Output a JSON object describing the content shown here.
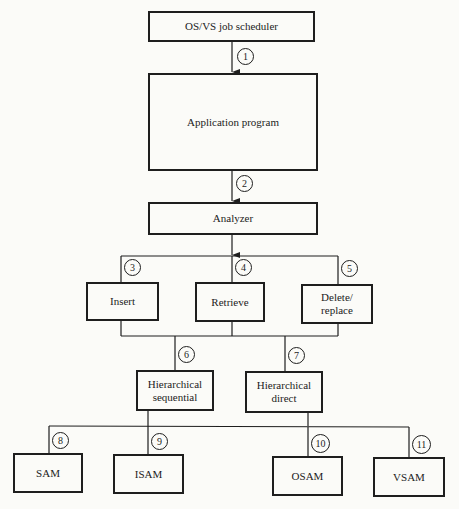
{
  "nodes": {
    "scheduler": "OS/VS job scheduler",
    "application": "Application program",
    "analyzer": "Analyzer",
    "insert": "Insert",
    "retrieve": "Retrieve",
    "delete_replace": "Delete/\nreplace",
    "hier_sequential": "Hierarchical\nsequential",
    "hier_direct": "Hierarchical\ndirect",
    "sam": "SAM",
    "isam": "ISAM",
    "osam": "OSAM",
    "vsam": "VSAM"
  },
  "labels": {
    "n1": "1",
    "n2": "2",
    "n3": "3",
    "n4": "4",
    "n5": "5",
    "n6": "6",
    "n7": "7",
    "n8": "8",
    "n9": "9",
    "n10": "10",
    "n11": "11"
  },
  "colors": {
    "line": "#1e1e1e",
    "background": "#fbfbf8"
  }
}
